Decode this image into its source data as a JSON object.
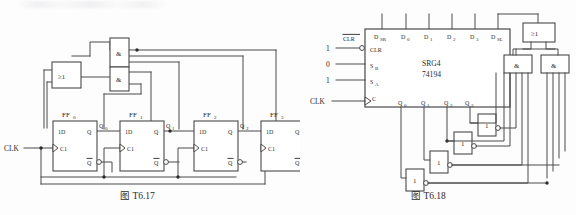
{
  "page": {
    "background_color": "#fdfdfd",
    "ink_color": "#4a4a4a",
    "text_color": "#2b2b2b"
  },
  "figures": [
    {
      "id": "fig-t617",
      "caption": "图 T6.17",
      "title_prefix": "图",
      "number": "T6.17",
      "description": "4-bit shift register counter built from four D flip-flops with feedback through AND and OR gates",
      "inputs": [
        {
          "name": "clock-input",
          "label": "CLK"
        }
      ],
      "gates": [
        {
          "id": "or1",
          "symbol": "≥1",
          "type": "or",
          "name": "or-gate-1"
        },
        {
          "id": "and1",
          "symbol": "&",
          "type": "and",
          "name": "and-gate-1"
        },
        {
          "id": "and2",
          "symbol": "&",
          "type": "and",
          "name": "and-gate-2"
        }
      ],
      "flipflops": [
        {
          "id": "ff0",
          "name": "FF",
          "index": "0",
          "d_label": "1D",
          "c_label": "C1",
          "q_label": "Q",
          "qn_label": "Q",
          "out_label": "Q",
          "out_index": "0"
        },
        {
          "id": "ff1",
          "name": "FF",
          "index": "1",
          "d_label": "1D",
          "c_label": "C1",
          "q_label": "Q",
          "qn_label": "Q",
          "out_label": "Q",
          "out_index": "1"
        },
        {
          "id": "ff2",
          "name": "FF",
          "index": "2",
          "d_label": "1D",
          "c_label": "C1",
          "q_label": "Q",
          "qn_label": "Q",
          "out_label": "Q",
          "out_index": "2"
        },
        {
          "id": "ff3",
          "name": "FF",
          "index": "3",
          "d_label": "1D",
          "c_label": "C1",
          "q_label": "Q",
          "qn_label": "Q",
          "out_label": "Q",
          "out_index": "3"
        }
      ]
    },
    {
      "id": "fig-t618",
      "caption": "图 T6.18",
      "title_prefix": "图",
      "number": "T6.18",
      "description": "74194 4-bit bidirectional universal shift register with feedback logic",
      "chip": {
        "name": "shift-register-chip",
        "function_label": "SRG4",
        "part_number": "74194",
        "top_pins": [
          {
            "label": "D",
            "sub": "SR"
          },
          {
            "label": "D",
            "sub": "0"
          },
          {
            "label": "D",
            "sub": "1"
          },
          {
            "label": "D",
            "sub": "2"
          },
          {
            "label": "D",
            "sub": "3"
          },
          {
            "label": "D",
            "sub": "SL"
          }
        ],
        "left_pins": [
          {
            "label": "CLR",
            "sub": "",
            "value": "1",
            "inverted": true,
            "clock": false,
            "overline_label": "CLR"
          },
          {
            "label": "S",
            "sub": "B",
            "value": "0",
            "inverted": false,
            "clock": false
          },
          {
            "label": "S",
            "sub": "A",
            "value": "1",
            "inverted": false,
            "clock": false
          },
          {
            "label": "C",
            "sub": "",
            "value": "CLK",
            "inverted": false,
            "clock": true
          }
        ],
        "bottom_pins": [
          {
            "label": "Q",
            "sub": "0"
          },
          {
            "label": "Q",
            "sub": "1"
          },
          {
            "label": "Q",
            "sub": "2"
          },
          {
            "label": "Q",
            "sub": "3"
          }
        ]
      },
      "gates": [
        {
          "id": "or1",
          "symbol": "≥1",
          "type": "or",
          "name": "or-gate-1"
        },
        {
          "id": "and1",
          "symbol": "&",
          "type": "and",
          "name": "and-gate-1"
        },
        {
          "id": "and2",
          "symbol": "&",
          "type": "and",
          "name": "and-gate-2"
        },
        {
          "id": "inv1",
          "symbol": "1",
          "type": "inverter",
          "name": "inverter-1"
        },
        {
          "id": "inv2",
          "symbol": "1",
          "type": "inverter",
          "name": "inverter-2"
        },
        {
          "id": "inv3",
          "symbol": "1",
          "type": "inverter",
          "name": "inverter-3"
        },
        {
          "id": "inv4",
          "symbol": "1",
          "type": "inverter",
          "name": "inverter-4"
        }
      ]
    }
  ]
}
